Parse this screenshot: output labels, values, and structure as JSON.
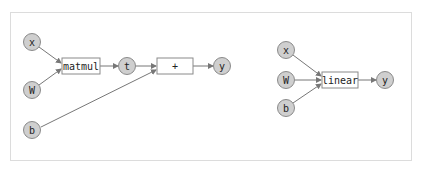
{
  "diagrams": [
    {
      "name": "decomposed",
      "inputs": [
        {
          "id": "x",
          "label": "x"
        },
        {
          "id": "W",
          "label": "W"
        },
        {
          "id": "b",
          "label": "b"
        }
      ],
      "ops": [
        {
          "id": "matmul",
          "label": "matmul"
        },
        {
          "id": "add",
          "label": "+"
        }
      ],
      "intermediates": [
        {
          "id": "t",
          "label": "t"
        }
      ],
      "outputs": [
        {
          "id": "y",
          "label": "y"
        }
      ],
      "edges": [
        [
          "x",
          "matmul"
        ],
        [
          "W",
          "matmul"
        ],
        [
          "matmul",
          "t"
        ],
        [
          "t",
          "add"
        ],
        [
          "b",
          "add"
        ],
        [
          "add",
          "y"
        ]
      ]
    },
    {
      "name": "fused",
      "inputs": [
        {
          "id": "x",
          "label": "x"
        },
        {
          "id": "W",
          "label": "W"
        },
        {
          "id": "b",
          "label": "b"
        }
      ],
      "ops": [
        {
          "id": "linear",
          "label": "linear"
        }
      ],
      "outputs": [
        {
          "id": "y",
          "label": "y"
        }
      ],
      "edges": [
        [
          "x",
          "linear"
        ],
        [
          "W",
          "linear"
        ],
        [
          "b",
          "linear"
        ],
        [
          "linear",
          "y"
        ]
      ]
    }
  ],
  "colors": {
    "node_fill": "#cfcfcf",
    "node_stroke": "#8a8a8a",
    "op_fill": "#ffffff",
    "edge": "#777777",
    "frame_border": "#dcdcdc"
  }
}
